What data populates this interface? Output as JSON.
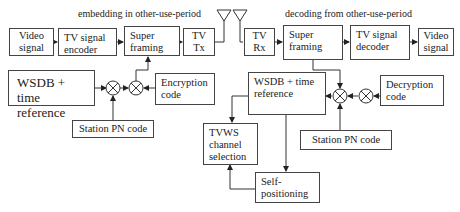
{
  "diagram": {
    "type": "block-diagram",
    "captions": {
      "transmit": "embedding in other-use-period",
      "receive": "decoding from other-use-period"
    },
    "transmitter": {
      "video_signal": "Video signal",
      "encoder": "TV signal encoder",
      "super_framing": "Super framing",
      "tx": "TV Tx",
      "wsdb": "WSDB + time reference",
      "encryption": "Encryption code",
      "station_pn": "Station PN code"
    },
    "receiver": {
      "rx": "TV Rx",
      "super_framing": "Super framing",
      "decoder": "TV signal decoder",
      "video_signal": "Video signal",
      "wsdb": "WSDB + time reference",
      "decryption": "Decryption code",
      "station_pn": "Station PN code",
      "tvws_selection": "TVWS channel selection",
      "self_positioning": "Self-positioning"
    },
    "edges": [
      [
        "Video signal",
        "TV signal encoder"
      ],
      [
        "TV signal encoder",
        "Super framing (Tx)"
      ],
      [
        "Super framing (Tx)",
        "TV Tx"
      ],
      [
        "WSDB + time reference (Tx)",
        "mixer 1 (Tx)"
      ],
      [
        "Station PN code (Tx)",
        "mixer 1 (Tx)"
      ],
      [
        "mixer 1 (Tx)",
        "mixer 2 (Tx)"
      ],
      [
        "Encryption code",
        "mixer 2 (Tx)"
      ],
      [
        "mixer 2 (Tx)",
        "Super framing (Tx)"
      ],
      [
        "TV Rx",
        "Super framing (Rx)"
      ],
      [
        "Super framing (Rx)",
        "TV signal decoder"
      ],
      [
        "TV signal decoder",
        "Video signal (Rx)"
      ],
      [
        "Super framing (Rx)",
        "mixer 1 (Rx)"
      ],
      [
        "Decryption code",
        "mixer 2 (Rx)"
      ],
      [
        "mixer 2 (Rx)",
        "mixer 1 (Rx)"
      ],
      [
        "Station PN code (Rx)",
        "mixer 1 (Rx)"
      ],
      [
        "mixer 1 (Rx)",
        "WSDB + time reference (Rx)"
      ],
      [
        "WSDB + time reference (Rx)",
        "TVWS channel selection"
      ],
      [
        "WSDB + time reference (Rx)",
        "Self-positioning"
      ],
      [
        "Self-positioning",
        "TVWS channel selection"
      ]
    ]
  }
}
